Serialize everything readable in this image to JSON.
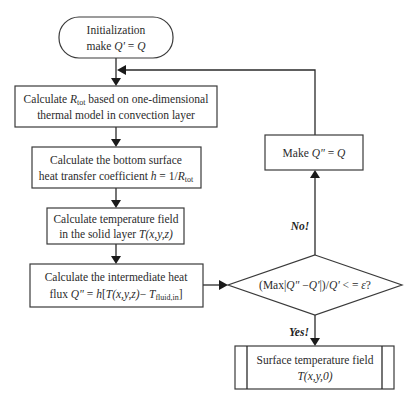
{
  "diagram": {
    "type": "flowchart",
    "nodes": {
      "start": {
        "shape": "terminal",
        "line1": "Initialization",
        "line2_prefix": "make ",
        "line2_var1": "Q'",
        "line2_eq": " = ",
        "line2_var2": "Q"
      },
      "calc_rtot": {
        "shape": "process",
        "line1_prefix": "Calculate ",
        "line1_var": "R",
        "line1_sub": "tot",
        "line1_suffix": " based on one-dimensional",
        "line2": "thermal model in convection layer"
      },
      "calc_h": {
        "shape": "process",
        "line1": "Calculate the bottom surface",
        "line2_prefix": "heat transfer coefficient ",
        "line2_var": "h",
        "line2_mid": " = 1/",
        "line2_var2": "R",
        "line2_sub": "tot"
      },
      "calc_t": {
        "shape": "process",
        "line1": "Calculate temperature field",
        "line2_prefix": "in the solid layer ",
        "line2_var": "T(x,y,z)"
      },
      "calc_flux": {
        "shape": "process",
        "line1": "Calculate the intermediate heat",
        "line2_prefix": "flux ",
        "line2_var1": "Q\"",
        "line2_eq": " = ",
        "line2_var2": "h",
        "line2_br": "[",
        "line2_var3": "T(x,y,z)",
        "line2_minus": "− ",
        "line2_var4": "T",
        "line2_sub": "fluid,in",
        "line2_close": "]"
      },
      "decision": {
        "shape": "decision",
        "text_prefix": "(Max|",
        "var1": "Q\"",
        "minus": " −",
        "var2": "Q'",
        "mid": "|)/",
        "var3": "Q'",
        "suffix": " < = ",
        "var4": "ε",
        "q": "?"
      },
      "update": {
        "shape": "process",
        "text_prefix": "Make ",
        "var1": "Q\"",
        "eq": " = ",
        "var2": "Q"
      },
      "result": {
        "shape": "predefined-process",
        "line1": "Surface temperature field",
        "line2": "T(x,y,0)"
      }
    },
    "edge_labels": {
      "no": "No!",
      "yes": "Yes!"
    },
    "edges": [
      [
        "start",
        "calc_rtot"
      ],
      [
        "calc_rtot",
        "calc_h"
      ],
      [
        "calc_h",
        "calc_t"
      ],
      [
        "calc_t",
        "calc_flux"
      ],
      [
        "calc_flux",
        "decision"
      ],
      [
        "decision",
        "update",
        "No!"
      ],
      [
        "decision",
        "result",
        "Yes!"
      ],
      [
        "update",
        "calc_rtot"
      ]
    ]
  }
}
